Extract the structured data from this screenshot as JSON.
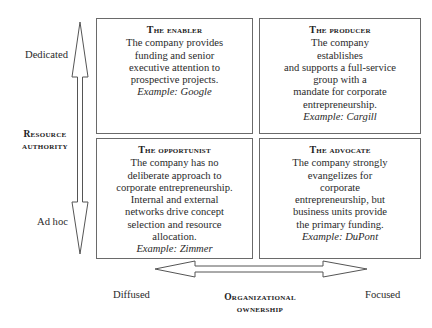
{
  "quadrants": {
    "top_left": {
      "title": "The enabler",
      "lines": [
        "The company provides",
        "funding and senior",
        "executive attention to",
        "prospective projects."
      ],
      "example": "Example: Google"
    },
    "top_right": {
      "title": "The producer",
      "lines": [
        "The company",
        "establishes",
        "and supports a full-service",
        "group with a",
        "mandate for corporate",
        "entrepreneurship."
      ],
      "example": "Example: Cargill"
    },
    "bottom_left": {
      "title": "The opportunist",
      "lines": [
        "The company has no",
        "deliberate approach to",
        "corporate entrepreneurship.",
        "Internal and external",
        "networks drive concept",
        "selection and resource",
        "allocation."
      ],
      "example": "Example: Zimmer"
    },
    "bottom_right": {
      "title": "The advocate",
      "lines": [
        "The company strongly",
        "evangelizes for",
        "corporate",
        "entrepreneurship, but",
        "business units provide",
        "the primary funding."
      ],
      "example": "Example: DuPont"
    }
  },
  "y_axis": {
    "title_line1": "Resource",
    "title_line2": "authority",
    "top_label": "Dedicated",
    "bottom_label": "Ad hoc"
  },
  "x_axis": {
    "title_line1": "Organizational",
    "title_line2": "ownership",
    "left_label": "Diffused",
    "right_label": "Focused"
  }
}
